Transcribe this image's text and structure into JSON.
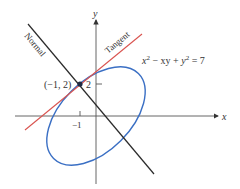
{
  "diagram": {
    "equation": "x² − xy + y² = 7",
    "equation_parts": {
      "a": "x",
      "a_exp": "2",
      "mid": " − xy + ",
      "b": "y",
      "b_exp": "2",
      "rhs": " = 7"
    },
    "axes": {
      "x_label": "x",
      "y_label": "y"
    },
    "ticks": {
      "x_tick": "−1",
      "y_tick": "2"
    },
    "point_label": "(−1, 2)",
    "lines": {
      "tangent_label": "Tangent",
      "normal_label": "Normal"
    },
    "colors": {
      "ellipse": "#3a6fc4",
      "tangent": "#d9534f",
      "normal": "#2a2a2a",
      "axes": "#555555",
      "point": "#1f2a44"
    }
  }
}
